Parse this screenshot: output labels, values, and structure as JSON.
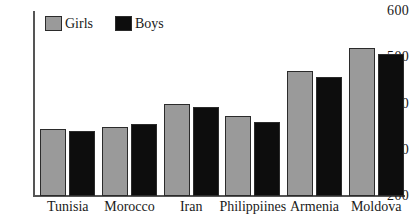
{
  "chart_data": {
    "type": "bar",
    "title": "",
    "subtitle": "",
    "xlabel": "",
    "ylabel": "",
    "categories": [
      "Tunisia",
      "Morocco",
      "Iran",
      "Philippiines",
      "Armenia",
      "Moldova"
    ],
    "series": [
      {
        "name": "Girls",
        "color": "#9a9a9a",
        "values": [
          345,
          350,
          400,
          372,
          470,
          520
        ]
      },
      {
        "name": "Boys",
        "color": "#0d0d0d",
        "values": [
          340,
          355,
          393,
          360,
          458,
          508
        ]
      }
    ],
    "ylim": [
      200,
      600
    ],
    "yticks": [
      200,
      300,
      400,
      500,
      600
    ],
    "ytick_labels": [
      "200",
      "300",
      "400",
      "500",
      "600"
    ],
    "grid": false,
    "legend_position": "top-left",
    "legend": [
      "Girls",
      "Boys"
    ],
    "axis_color": "#555555",
    "bar_border_color": "#2b2b2b",
    "background": "#ffffff"
  }
}
